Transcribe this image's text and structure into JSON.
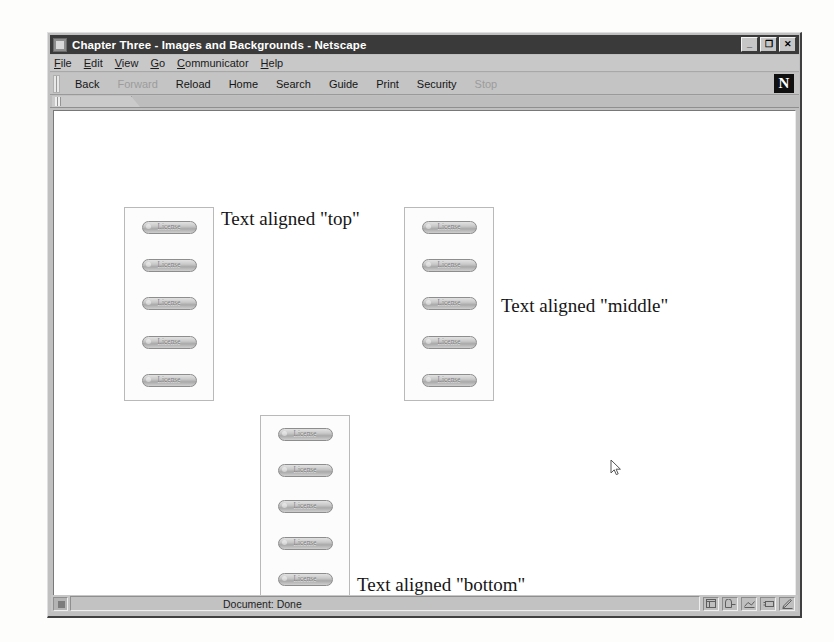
{
  "window": {
    "title": "Chapter Three - Images and Backgrounds - Netscape",
    "title_icon": "netscape-window-icon",
    "controls": [
      {
        "name": "minimize",
        "glyph": "_"
      },
      {
        "name": "restore",
        "glyph": "❐"
      },
      {
        "name": "close",
        "glyph": "✕"
      }
    ]
  },
  "menubar": {
    "items": [
      {
        "name": "file",
        "accel": "F",
        "rest": "ile"
      },
      {
        "name": "edit",
        "accel": "E",
        "rest": "dit"
      },
      {
        "name": "view",
        "accel": "V",
        "rest": "iew"
      },
      {
        "name": "go",
        "accel": "G",
        "rest": "o"
      },
      {
        "name": "communicator",
        "accel": "C",
        "rest": "ommunicator"
      },
      {
        "name": "help",
        "accel": "H",
        "rest": "elp"
      }
    ]
  },
  "toolbar": {
    "buttons": [
      {
        "name": "back",
        "label": "Back",
        "disabled": false
      },
      {
        "name": "forward",
        "label": "Forward",
        "disabled": true
      },
      {
        "name": "reload",
        "label": "Reload",
        "disabled": false
      },
      {
        "name": "home",
        "label": "Home",
        "disabled": false
      },
      {
        "name": "search",
        "label": "Search",
        "disabled": false
      },
      {
        "name": "guide",
        "label": "Guide",
        "disabled": false
      },
      {
        "name": "print",
        "label": "Print",
        "disabled": false
      },
      {
        "name": "security",
        "label": "Security",
        "disabled": false
      },
      {
        "name": "stop",
        "label": "Stop",
        "disabled": true
      }
    ],
    "logo": "N"
  },
  "page": {
    "blocks": [
      {
        "name": "top-aligned-block",
        "caption": "Text aligned \"top\"",
        "align": "top",
        "box": {
          "left": 70,
          "top": 96,
          "width": 90,
          "height": 194
        },
        "caption_left": 163,
        "caption_top": 98,
        "images": [
          {
            "name": "license-image",
            "label": "License"
          },
          {
            "name": "license-image",
            "label": "License"
          },
          {
            "name": "license-image",
            "label": "License"
          },
          {
            "name": "license-image",
            "label": "License"
          },
          {
            "name": "license-image",
            "label": "License"
          }
        ]
      },
      {
        "name": "middle-aligned-block",
        "caption": "Text aligned \"middle\"",
        "align": "middle",
        "box": {
          "left": 350,
          "top": 96,
          "width": 90,
          "height": 194
        },
        "caption_left": 443,
        "caption_top": 185,
        "images": [
          {
            "name": "license-image",
            "label": "License"
          },
          {
            "name": "license-image",
            "label": "License"
          },
          {
            "name": "license-image",
            "label": "License"
          },
          {
            "name": "license-image",
            "label": "License"
          },
          {
            "name": "license-image",
            "label": "License"
          }
        ]
      },
      {
        "name": "bottom-aligned-block",
        "caption": "Text aligned \"bottom\"",
        "align": "bottom",
        "box": {
          "left": 206,
          "top": 304,
          "width": 90,
          "height": 184
        },
        "caption_left": 299,
        "caption_top": 464,
        "images": [
          {
            "name": "license-image",
            "label": "License"
          },
          {
            "name": "license-image",
            "label": "License"
          },
          {
            "name": "license-image",
            "label": "License"
          },
          {
            "name": "license-image",
            "label": "License"
          },
          {
            "name": "license-image",
            "label": "License"
          }
        ]
      }
    ],
    "cursor": {
      "x": 556,
      "y": 348
    }
  },
  "statusbar": {
    "security_icon": "padlock-icon",
    "text": "Document: Done",
    "component_icons": [
      {
        "name": "navigator-icon"
      },
      {
        "name": "mailbox-icon"
      },
      {
        "name": "newsgroup-icon"
      },
      {
        "name": "address-book-icon"
      },
      {
        "name": "composer-icon"
      }
    ]
  }
}
